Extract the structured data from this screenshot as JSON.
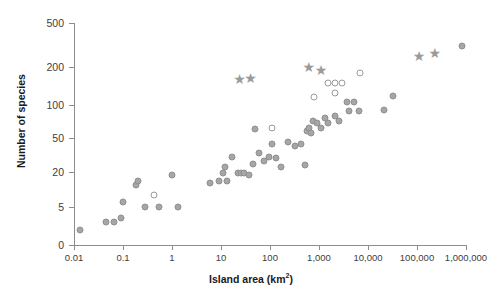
{
  "chart_data": {
    "type": "scatter",
    "title": "",
    "xlabel": "Island area (km2)",
    "xlabel_base": "Island area (km",
    "xlabel_sup": "2",
    "xlabel_close": ")",
    "ylabel": "Number of species",
    "xscale": "log",
    "yscale": "log-like",
    "xlim": [
      0.01,
      1000000
    ],
    "ylim": [
      0,
      500
    ],
    "grid": false,
    "legend": false,
    "xticks": [
      0.01,
      0.1,
      1,
      10,
      100,
      1000,
      10000,
      100000,
      1000000
    ],
    "xtick_labels": [
      "0.01",
      "0.1",
      "1",
      "10",
      "100",
      "1,000",
      "10,000",
      "100,000",
      "1,000,000"
    ],
    "yticks": [
      0,
      5,
      20,
      50,
      100,
      200,
      500
    ],
    "ytick_labels": [
      "0",
      "5",
      "20",
      "50",
      "100",
      "200",
      "500"
    ],
    "series": [
      {
        "name": "filled-circles",
        "marker": "filled-circle",
        "color": "#a6a6a6",
        "points": [
          {
            "x": 0.013,
            "y": 2
          },
          {
            "x": 0.045,
            "y": 3
          },
          {
            "x": 0.065,
            "y": 3
          },
          {
            "x": 0.09,
            "y": 3.5
          },
          {
            "x": 0.1,
            "y": 6
          },
          {
            "x": 0.18,
            "y": 12
          },
          {
            "x": 0.2,
            "y": 14
          },
          {
            "x": 0.28,
            "y": 5
          },
          {
            "x": 0.55,
            "y": 5
          },
          {
            "x": 1.0,
            "y": 18
          },
          {
            "x": 1.3,
            "y": 5
          },
          {
            "x": 6.0,
            "y": 13
          },
          {
            "x": 9.0,
            "y": 14
          },
          {
            "x": 11.0,
            "y": 19
          },
          {
            "x": 12.0,
            "y": 23
          },
          {
            "x": 13.0,
            "y": 14
          },
          {
            "x": 17.0,
            "y": 30
          },
          {
            "x": 22.0,
            "y": 19
          },
          {
            "x": 26.0,
            "y": 19
          },
          {
            "x": 30.0,
            "y": 19
          },
          {
            "x": 38.0,
            "y": 18
          },
          {
            "x": 45.0,
            "y": 25
          },
          {
            "x": 50.0,
            "y": 60
          },
          {
            "x": 60.0,
            "y": 33
          },
          {
            "x": 75.0,
            "y": 27
          },
          {
            "x": 95.0,
            "y": 30
          },
          {
            "x": 110.0,
            "y": 42
          },
          {
            "x": 130.0,
            "y": 29
          },
          {
            "x": 165.0,
            "y": 23
          },
          {
            "x": 230.0,
            "y": 45
          },
          {
            "x": 330.0,
            "y": 40
          },
          {
            "x": 430.0,
            "y": 42
          },
          {
            "x": 520.0,
            "y": 24
          },
          {
            "x": 560.0,
            "y": 58
          },
          {
            "x": 620.0,
            "y": 62
          },
          {
            "x": 700.0,
            "y": 55
          },
          {
            "x": 760.0,
            "y": 72
          },
          {
            "x": 900.0,
            "y": 68
          },
          {
            "x": 1100.0,
            "y": 62
          },
          {
            "x": 1300.0,
            "y": 76
          },
          {
            "x": 1500.0,
            "y": 68
          },
          {
            "x": 2100.0,
            "y": 80
          },
          {
            "x": 2600.0,
            "y": 72
          },
          {
            "x": 3800.0,
            "y": 105
          },
          {
            "x": 5200.0,
            "y": 105
          },
          {
            "x": 4000.0,
            "y": 88
          },
          {
            "x": 6500.0,
            "y": 88
          },
          {
            "x": 21000.0,
            "y": 90
          },
          {
            "x": 33000.0,
            "y": 118
          },
          {
            "x": 810000.0,
            "y": 310
          }
        ]
      },
      {
        "name": "open-circles",
        "marker": "open-circle",
        "color": "#ffffff",
        "points": [
          {
            "x": 0.42,
            "y": 8
          },
          {
            "x": 110.0,
            "y": 62
          },
          {
            "x": 800.0,
            "y": 115
          },
          {
            "x": 1500.0,
            "y": 150
          },
          {
            "x": 2100.0,
            "y": 150
          },
          {
            "x": 2900.0,
            "y": 150
          },
          {
            "x": 2100.0,
            "y": 125
          },
          {
            "x": 7000.0,
            "y": 178
          }
        ]
      },
      {
        "name": "stars",
        "marker": "star",
        "color": "#9b9b9b",
        "points": [
          {
            "x": 24.0,
            "y": 160
          },
          {
            "x": 40.0,
            "y": 163
          },
          {
            "x": 620.0,
            "y": 200
          },
          {
            "x": 1100.0,
            "y": 190
          },
          {
            "x": 110000.0,
            "y": 250
          },
          {
            "x": 230000.0,
            "y": 265
          }
        ]
      }
    ]
  }
}
